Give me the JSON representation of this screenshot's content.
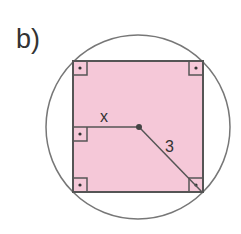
{
  "figure": {
    "label": "b)",
    "segment_labels": {
      "x": "x",
      "radius": "3"
    },
    "shapes": {
      "circle": {
        "cx": 138,
        "cy": 127,
        "r": 92
      },
      "square": {
        "x": 73,
        "y": 61,
        "size": 130
      },
      "center_point": {
        "cx": 139,
        "cy": 127
      }
    },
    "right_angle_markers": [
      "top-left",
      "top-right",
      "left-midpoint",
      "bottom-left",
      "bottom-right"
    ],
    "colors": {
      "fill": "#f5c8d8",
      "stroke": "#555555",
      "circle_stroke": "#777777",
      "text": "#333333"
    }
  }
}
